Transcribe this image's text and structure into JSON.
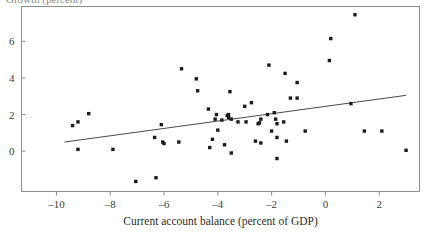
{
  "figure": {
    "background_color": "#ffffff",
    "frame_color": "#8d8d8d",
    "point_color": "#1b1b1b",
    "line_color": "#4a4a4a",
    "clipped_header_text": "Growth (percent)"
  },
  "chart_data": {
    "type": "scatter",
    "title": "",
    "subtitle": "",
    "xlabel": "Current account balance (percent of GDP)",
    "ylabel": "",
    "xlim": [
      -11.3,
      3.5
    ],
    "ylim": [
      -2.2,
      7.9
    ],
    "xticks": [
      -10,
      -8,
      -6,
      -4,
      -2,
      0,
      2
    ],
    "xtick_labels": [
      "–10",
      "–8",
      "–6",
      "–4",
      "–2",
      "0",
      "2"
    ],
    "yticks": [
      0,
      2,
      4,
      6
    ],
    "ytick_labels": [
      "0",
      "2",
      "4",
      "6"
    ],
    "grid": false,
    "legend": false,
    "legend_position": "none",
    "series": [
      {
        "name": "countries",
        "marker": "square",
        "marker_size": 2.2,
        "points": [
          [
            -9.4,
            1.4
          ],
          [
            -9.2,
            1.6
          ],
          [
            -9.2,
            0.1
          ],
          [
            -8.8,
            2.05
          ],
          [
            -7.9,
            0.1
          ],
          [
            -7.05,
            -1.65
          ],
          [
            -6.35,
            0.75
          ],
          [
            -6.3,
            -1.45
          ],
          [
            -6.1,
            1.45
          ],
          [
            -6.05,
            0.5
          ],
          [
            -6.0,
            0.42
          ],
          [
            -5.45,
            0.5
          ],
          [
            -5.35,
            4.5
          ],
          [
            -4.8,
            3.95
          ],
          [
            -4.75,
            3.3
          ],
          [
            -4.35,
            2.3
          ],
          [
            -4.3,
            0.2
          ],
          [
            -4.2,
            0.65
          ],
          [
            -4.1,
            1.75
          ],
          [
            -4.05,
            2.0
          ],
          [
            -4.0,
            1.15
          ],
          [
            -3.85,
            1.7
          ],
          [
            -3.75,
            0.35
          ],
          [
            -3.65,
            1.95
          ],
          [
            -3.6,
            1.85
          ],
          [
            -3.6,
            2.0
          ],
          [
            -3.55,
            3.25
          ],
          [
            -3.5,
            1.75
          ],
          [
            -3.5,
            -0.1
          ],
          [
            -3.25,
            1.6
          ],
          [
            -3.0,
            2.45
          ],
          [
            -2.95,
            1.6
          ],
          [
            -2.75,
            2.65
          ],
          [
            -2.6,
            0.55
          ],
          [
            -2.5,
            1.5
          ],
          [
            -2.45,
            1.55
          ],
          [
            -2.4,
            0.45
          ],
          [
            -2.4,
            1.75
          ],
          [
            -2.15,
            2.0
          ],
          [
            -2.1,
            4.7
          ],
          [
            -2.0,
            1.1
          ],
          [
            -1.9,
            2.1
          ],
          [
            -1.85,
            1.75
          ],
          [
            -1.8,
            0.75
          ],
          [
            -1.8,
            1.5
          ],
          [
            -1.8,
            -0.4
          ],
          [
            -1.55,
            1.6
          ],
          [
            -1.5,
            4.25
          ],
          [
            -1.45,
            0.55
          ],
          [
            -1.3,
            2.9
          ],
          [
            -1.05,
            2.9
          ],
          [
            -1.05,
            3.75
          ],
          [
            -0.75,
            1.1
          ],
          [
            0.15,
            4.95
          ],
          [
            0.2,
            6.15
          ],
          [
            0.95,
            2.6
          ],
          [
            1.1,
            7.45
          ],
          [
            1.45,
            1.1
          ],
          [
            2.1,
            1.1
          ],
          [
            3.0,
            0.05
          ]
        ]
      }
    ],
    "trend_line": {
      "name": "fitted regression line",
      "x_start": -9.7,
      "y_start": 0.5,
      "x_end": 3.0,
      "y_end": 3.05
    }
  }
}
